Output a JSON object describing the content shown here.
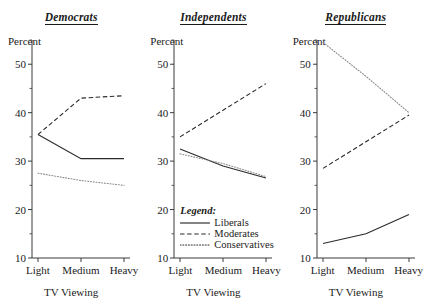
{
  "figure": {
    "axis_label_y": "Percent",
    "axis_label_x": "TV Viewing",
    "categories": [
      "Light",
      "Medium",
      "Heavy"
    ],
    "yticks": [
      "10",
      "20",
      "30",
      "40",
      "50"
    ],
    "legend": {
      "title": "Legend:",
      "entries": [
        {
          "label": "Liberals",
          "style": "solid"
        },
        {
          "label": "Moderates",
          "style": "dashed"
        },
        {
          "label": "Conservatives",
          "style": "dotted"
        }
      ]
    },
    "colors": {
      "axis": "#3a3a3a",
      "solid": "#2b2b2b",
      "dashed": "#2b2b2b",
      "dotted": "#8a8a8a",
      "background": "#ffffff"
    }
  },
  "chart_data": [
    {
      "type": "line",
      "title": "Democrats",
      "xlabel": "TV Viewing",
      "ylabel": "Percent",
      "categories": [
        "Light",
        "Medium",
        "Heavy"
      ],
      "ylim": [
        10,
        55
      ],
      "yticks": [
        10,
        20,
        30,
        40,
        50
      ],
      "grid": false,
      "legend_position": "none",
      "series": [
        {
          "name": "Liberals",
          "style": "solid",
          "values": [
            35.5,
            30.5,
            30.5
          ]
        },
        {
          "name": "Moderates",
          "style": "dashed",
          "values": [
            35.5,
            43.0,
            43.5
          ]
        },
        {
          "name": "Conservatives",
          "style": "dotted",
          "values": [
            27.5,
            26.0,
            25.0
          ]
        }
      ]
    },
    {
      "type": "line",
      "title": "Independents",
      "xlabel": "TV Viewing",
      "ylabel": "Percent",
      "categories": [
        "Light",
        "Medium",
        "Heavy"
      ],
      "ylim": [
        10,
        55
      ],
      "yticks": [
        10,
        20,
        30,
        40,
        50
      ],
      "grid": false,
      "legend_position": "inside-bottom-left",
      "series": [
        {
          "name": "Liberals",
          "style": "solid",
          "values": [
            32.5,
            29.0,
            26.5
          ]
        },
        {
          "name": "Moderates",
          "style": "dashed",
          "values": [
            35.0,
            40.5,
            46.0
          ]
        },
        {
          "name": "Conservatives",
          "style": "dotted",
          "values": [
            31.5,
            29.5,
            26.8
          ]
        }
      ]
    },
    {
      "type": "line",
      "title": "Republicans",
      "xlabel": "TV Viewing",
      "ylabel": "Percent",
      "categories": [
        "Light",
        "Medium",
        "Heavy"
      ],
      "ylim": [
        10,
        55
      ],
      "yticks": [
        10,
        20,
        30,
        40,
        50
      ],
      "grid": false,
      "legend_position": "none",
      "series": [
        {
          "name": "Liberals",
          "style": "solid",
          "values": [
            13.0,
            15.0,
            19.0
          ]
        },
        {
          "name": "Moderates",
          "style": "dashed",
          "values": [
            28.5,
            34.0,
            39.5
          ]
        },
        {
          "name": "Conservatives",
          "style": "dotted",
          "values": [
            54.5,
            47.5,
            40.0
          ]
        }
      ]
    }
  ]
}
